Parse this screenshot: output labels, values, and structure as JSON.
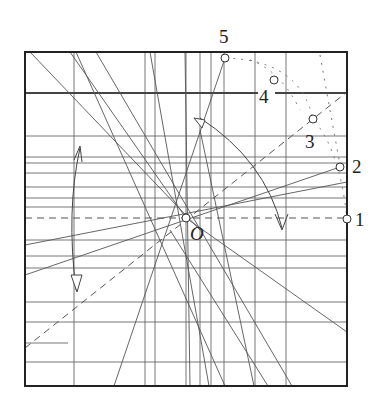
{
  "figure": {
    "type": "geometric construction",
    "colors": {
      "line": "#555555",
      "frame": "#222222",
      "background": "#ffffff",
      "point_fill": "#ffffff"
    },
    "frame": {
      "x": 25,
      "y": 52,
      "width": 322,
      "height": 334
    }
  },
  "labels": {
    "origin": "O",
    "p1": "1",
    "p2": "2",
    "p3": "3",
    "p4": "4",
    "p5": "5"
  },
  "points": [
    {
      "id": "O",
      "x": 186,
      "y": 218
    },
    {
      "id": "1",
      "x": 347,
      "y": 219
    },
    {
      "id": "2",
      "x": 340,
      "y": 167
    },
    {
      "id": "3",
      "x": 313,
      "y": 119
    },
    {
      "id": "4",
      "x": 274,
      "y": 80
    },
    {
      "id": "5",
      "x": 225,
      "y": 58
    }
  ],
  "vertical_lines_x": [
    74,
    145,
    155,
    186,
    200,
    211,
    224,
    255,
    286
  ],
  "horizontal_lines_y": [
    93,
    136,
    157,
    163,
    173,
    187,
    198,
    207,
    240,
    256,
    268,
    302,
    322,
    362
  ]
}
